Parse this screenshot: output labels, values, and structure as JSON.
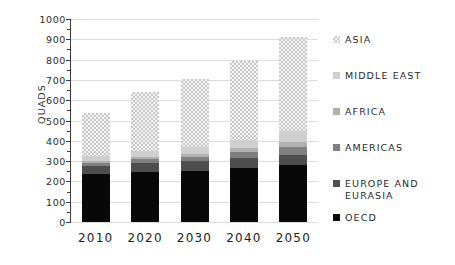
{
  "chart_data": {
    "type": "bar",
    "subtype": "stacked-bar",
    "title": "",
    "xlabel": "",
    "ylabel": "Quads",
    "ylim": [
      0,
      1000
    ],
    "ytick_step": 100,
    "yticks": [
      "0",
      "100",
      "200",
      "300",
      "400",
      "500",
      "600",
      "700",
      "800",
      "900",
      "1000"
    ],
    "minor_tick_step": 50,
    "grid": "horizontal",
    "legend_position": "right",
    "categories": [
      "2010",
      "2020",
      "2030",
      "2040",
      "2050"
    ],
    "series": [
      {
        "name": "OECD",
        "color": "#080808",
        "values": [
          237,
          248,
          252,
          268,
          283
        ]
      },
      {
        "name": "Europe and Eurasia",
        "color": "#4e4e4e",
        "values": [
          277,
          292,
          302,
          317,
          332
        ]
      },
      {
        "name": "Americas",
        "color": "#808080",
        "values": [
          292,
          310,
          322,
          343,
          368
        ]
      },
      {
        "name": "Africa",
        "color": "#b0b0b0",
        "values": [
          303,
          322,
          337,
          363,
          392
        ]
      },
      {
        "name": "Middle East",
        "color": "#cfcfcf",
        "values": [
          323,
          348,
          368,
          402,
          447
        ]
      },
      {
        "name": "Asia",
        "color": "#e0e0e0",
        "values": [
          535,
          640,
          703,
          793,
          910
        ]
      }
    ],
    "stack_cumulative": true,
    "totals": [
      535,
      640,
      703,
      793,
      910
    ]
  },
  "legend": {
    "items": [
      {
        "label": "Asia",
        "swatch": "asia"
      },
      {
        "label": "Middle East",
        "swatch": "me"
      },
      {
        "label": "Africa",
        "swatch": "africa"
      },
      {
        "label": "Americas",
        "swatch": "amer"
      },
      {
        "label": "Europe and Eurasia",
        "swatch": "europe"
      },
      {
        "label": "OECD",
        "swatch": "oecd"
      }
    ]
  },
  "axis": {
    "y_title": "Quads"
  }
}
